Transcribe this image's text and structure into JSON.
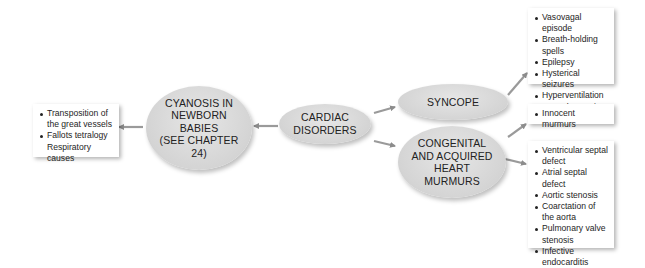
{
  "diagram": {
    "central_node": {
      "label": "CARDIAC\nDISORDERS"
    },
    "nodes": {
      "cyanosis": {
        "label": "CYANOSIS IN\nNEWBORN\nBABIES\n(SEE CHAPTER\n24)"
      },
      "syncope": {
        "label": "SYNCOPE"
      },
      "murmurs": {
        "label": "CONGENITAL\nAND ACQUIRED\nHEART\nMURMURS"
      }
    },
    "boxes": {
      "cyanosis_causes": {
        "items": [
          {
            "text": "Transposition of the great vessels",
            "bullet": true
          },
          {
            "text": "Fallots tetralogy",
            "bullet": true
          },
          {
            "text": "Respiratory causes",
            "bullet": false
          }
        ]
      },
      "syncope_causes": {
        "items": [
          {
            "text": "Vasovagal episode",
            "bullet": true
          },
          {
            "text": "Breath-holding spells",
            "bullet": true
          },
          {
            "text": "Epilepsy",
            "bullet": true
          },
          {
            "text": "Hysterical seizures",
            "bullet": true
          },
          {
            "text": "Hyperventilation",
            "bullet": true
          },
          {
            "text": "Hypoglycaemia",
            "bullet": true
          }
        ]
      },
      "innocent": {
        "items": [
          {
            "text": "Innocent murmurs",
            "bullet": true
          }
        ]
      },
      "murmur_causes": {
        "items": [
          {
            "text": "Ventricular septal defect",
            "bullet": true
          },
          {
            "text": "Atrial septal defect",
            "bullet": true
          },
          {
            "text": "Aortic stenosis",
            "bullet": true
          },
          {
            "text": "Coarctation of the aorta",
            "bullet": true
          },
          {
            "text": "Pulmonary valve stenosis",
            "bullet": true
          },
          {
            "text": "Infective endocarditis",
            "bullet": true
          }
        ]
      }
    },
    "colors": {
      "ellipse_fill": "#d4d4d4",
      "arrow": "#8c8c8c",
      "box_bg": "#ffffff"
    }
  }
}
